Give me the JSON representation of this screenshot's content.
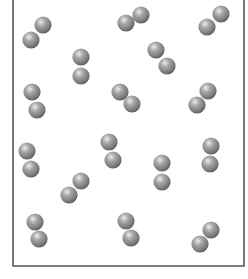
{
  "diagram": {
    "container": {
      "left": 13,
      "right": 244,
      "top": 0,
      "bottom": 266,
      "open_top": true,
      "stroke_color": "#555555",
      "stroke_width": 1.6
    },
    "atom_radius": 8.6,
    "atom_colors": {
      "highlight": "#e6e6e6",
      "mid": "#9a9a9a",
      "shadow": "#5a5a5a"
    },
    "molecules": [
      {
        "id": 1,
        "atoms": [
          [
            43,
            25
          ],
          [
            31,
            40
          ]
        ]
      },
      {
        "id": 2,
        "atoms": [
          [
            81,
            57
          ],
          [
            81,
            76
          ]
        ]
      },
      {
        "id": 3,
        "atoms": [
          [
            32,
            92
          ],
          [
            37,
            110
          ]
        ]
      },
      {
        "id": 4,
        "atoms": [
          [
            141,
            15
          ],
          [
            126,
            23
          ]
        ]
      },
      {
        "id": 5,
        "atoms": [
          [
            156,
            50
          ],
          [
            167,
            66
          ]
        ]
      },
      {
        "id": 6,
        "atoms": [
          [
            120,
            92
          ],
          [
            132,
            104
          ]
        ]
      },
      {
        "id": 7,
        "atoms": [
          [
            221,
            14
          ],
          [
            207,
            27
          ]
        ]
      },
      {
        "id": 8,
        "atoms": [
          [
            208,
            91
          ],
          [
            197,
            105
          ]
        ]
      },
      {
        "id": 9,
        "atoms": [
          [
            109,
            142
          ],
          [
            113,
            160
          ]
        ]
      },
      {
        "id": 10,
        "atoms": [
          [
            162,
            163
          ],
          [
            162,
            182
          ]
        ]
      },
      {
        "id": 11,
        "atoms": [
          [
            27,
            151
          ],
          [
            31,
            169
          ]
        ]
      },
      {
        "id": 12,
        "atoms": [
          [
            81,
            181
          ],
          [
            69,
            195
          ]
        ]
      },
      {
        "id": 13,
        "atoms": [
          [
            211,
            146
          ],
          [
            210,
            164
          ]
        ]
      },
      {
        "id": 14,
        "atoms": [
          [
            35,
            222
          ],
          [
            39,
            239
          ]
        ]
      },
      {
        "id": 15,
        "atoms": [
          [
            126,
            221
          ],
          [
            131,
            238
          ]
        ]
      },
      {
        "id": 16,
        "atoms": [
          [
            211,
            230
          ],
          [
            200,
            244
          ]
        ]
      }
    ]
  }
}
